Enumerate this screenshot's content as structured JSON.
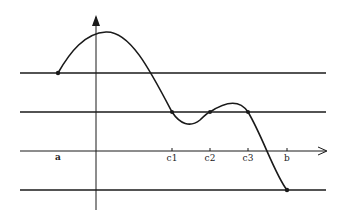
{
  "diagram": {
    "x_axis_labels": [
      {
        "id": "a",
        "text": "a",
        "x": 58
      },
      {
        "id": "c1",
        "text": "c1",
        "x": 172
      },
      {
        "id": "c2",
        "text": "c2",
        "x": 210
      },
      {
        "id": "c3",
        "text": "c3",
        "x": 248
      },
      {
        "id": "b",
        "text": "b",
        "x": 287
      }
    ],
    "horizontal_lines_y": [
      73,
      112,
      151,
      190
    ],
    "marked_points": [
      {
        "name": "a",
        "x": 58,
        "y": 73
      },
      {
        "name": "c1",
        "x": 172,
        "y": 112
      },
      {
        "name": "c2",
        "x": 210,
        "y": 112
      },
      {
        "name": "c3",
        "x": 248,
        "y": 112
      },
      {
        "name": "b",
        "x": 287,
        "y": 190
      }
    ],
    "colors": {
      "line": "#1a1a1a",
      "background": "#ffffff"
    }
  }
}
